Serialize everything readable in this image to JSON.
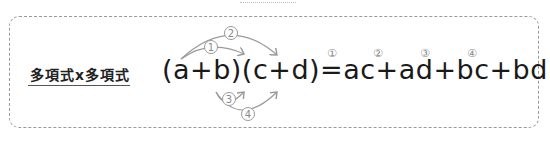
{
  "heading": "多項式x多項式",
  "formula": {
    "left": "(a+b)(c+d)",
    "equals": "=",
    "right": "ac+ad+bc+bd",
    "terms": [
      {
        "marker": "①",
        "term": "ac"
      },
      {
        "marker": "②",
        "term": "ad"
      },
      {
        "marker": "③",
        "term": "bc"
      },
      {
        "marker": "④",
        "term": "bd"
      }
    ]
  },
  "arrows": [
    {
      "marker": "①",
      "from": "a",
      "to": "c"
    },
    {
      "marker": "②",
      "from": "a",
      "to": "d"
    },
    {
      "marker": "③",
      "from": "b",
      "to": "c"
    },
    {
      "marker": "④",
      "from": "b",
      "to": "d"
    }
  ],
  "colors": {
    "text": "#1a1a1a",
    "arrow": "#9a9a9a",
    "border": "#9a9a9a"
  }
}
